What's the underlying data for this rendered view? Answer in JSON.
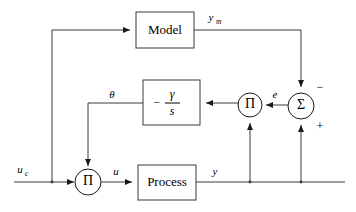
{
  "diagram": {
    "blocks": [
      {
        "id": "model",
        "label": "Model",
        "x": 136,
        "y": 12,
        "w": 58,
        "h": 36
      },
      {
        "id": "adapt",
        "label": "-y/s",
        "x": 143,
        "y": 80,
        "w": 57,
        "h": 45
      },
      {
        "id": "process",
        "label": "Process",
        "x": 138,
        "y": 165,
        "w": 58,
        "h": 35
      }
    ],
    "adaptation_block": {
      "numerator": "γ",
      "denominator": "s",
      "sign": "−"
    },
    "operators": [
      {
        "id": "pi-adapt",
        "symbol": "Π",
        "cx": 250,
        "cy": 105,
        "r": 12
      },
      {
        "id": "sigma",
        "symbol": "Σ",
        "cx": 301,
        "cy": 106,
        "r": 13
      },
      {
        "id": "pi-input",
        "symbol": "Π",
        "cx": 88,
        "cy": 182,
        "r": 13
      }
    ],
    "signals": [
      {
        "id": "uc",
        "base": "u",
        "subscript": "c",
        "x": 20,
        "y": 170
      },
      {
        "id": "u",
        "base": "u",
        "subscript": "",
        "x": 116,
        "y": 172
      },
      {
        "id": "y",
        "base": "y",
        "subscript": "",
        "x": 215,
        "y": 172
      },
      {
        "id": "ym",
        "base": "y",
        "subscript": "m",
        "x": 213,
        "y": 18
      },
      {
        "id": "e",
        "base": "e",
        "subscript": "",
        "x": 275,
        "y": 95
      },
      {
        "id": "theta",
        "base": "θ",
        "subscript": "",
        "x": 112,
        "y": 95
      }
    ],
    "signs": [
      {
        "id": "minus-sign",
        "symbol": "−",
        "x": 320,
        "y": 88
      },
      {
        "id": "plus-sign",
        "symbol": "+",
        "x": 320,
        "y": 127
      }
    ],
    "colors": {
      "wire": "#3a3a3a",
      "box_stroke": "#3a3a3a",
      "background": "#ffffff",
      "text": "#000000"
    }
  }
}
